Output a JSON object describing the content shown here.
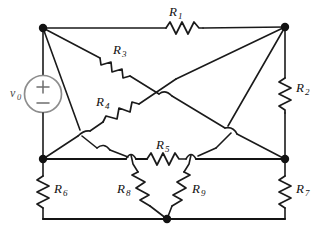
{
  "figure": {
    "kind": "electrical-circuit-schematic",
    "background_color": "#ffffff",
    "wire_color": "#1a1a1a",
    "source_color": "#8d8d8d",
    "width": 323,
    "height": 234
  },
  "source": {
    "name": "voltage-source",
    "label": "v",
    "label_subscript": "0",
    "symbol": "circle",
    "plus_sign": "+",
    "minus_sign": "−",
    "polarity_top": "+",
    "polarity_bottom": "−"
  },
  "resistors": [
    {
      "id": "R1",
      "label": "R",
      "subscript": "1",
      "orientation": "horizontal",
      "label_pos": "above",
      "from_node": "top-left",
      "to_node": "top-right"
    },
    {
      "id": "R2",
      "label": "R",
      "subscript": "2",
      "orientation": "vertical",
      "label_pos": "right",
      "from_node": "top-right",
      "to_node": "right-middle"
    },
    {
      "id": "R3",
      "label": "R",
      "subscript": "3",
      "orientation": "diagonal-down-right",
      "label_pos": "above-right",
      "from_node": "top-left",
      "to_node": "center-upper"
    },
    {
      "id": "R4",
      "label": "R",
      "subscript": "4",
      "orientation": "diagonal-up-right",
      "label_pos": "above-left",
      "from_node": "left-middle",
      "to_node": "center-upper"
    },
    {
      "id": "R5",
      "label": "R",
      "subscript": "5",
      "orientation": "horizontal",
      "label_pos": "above",
      "from_node": "left-middle",
      "to_node": "right-middle"
    },
    {
      "id": "R6",
      "label": "R",
      "subscript": "6",
      "orientation": "vertical",
      "label_pos": "right",
      "from_node": "left-middle",
      "to_node": "bottom-left"
    },
    {
      "id": "R7",
      "label": "R",
      "subscript": "7",
      "orientation": "vertical",
      "label_pos": "right",
      "from_node": "right-middle",
      "to_node": "bottom-right"
    },
    {
      "id": "R8",
      "label": "R",
      "subscript": "8",
      "orientation": "diagonal-down-right",
      "label_pos": "left",
      "from_node": "branch-left",
      "to_node": "bottom-center"
    },
    {
      "id": "R9",
      "label": "R",
      "subscript": "9",
      "orientation": "diagonal-down-left",
      "label_pos": "right",
      "from_node": "branch-right",
      "to_node": "bottom-center"
    }
  ],
  "nodes": [
    {
      "id": "top-left",
      "x": 43,
      "y": 28,
      "dot": true
    },
    {
      "id": "top-right",
      "x": 285,
      "y": 27,
      "dot": true
    },
    {
      "id": "left-middle",
      "x": 43,
      "y": 159,
      "dot": true
    },
    {
      "id": "right-middle",
      "x": 285,
      "y": 159,
      "dot": true
    },
    {
      "id": "bottom-center",
      "x": 167,
      "y": 219,
      "dot": true
    }
  ],
  "crossings": {
    "style": "wire-hop-semicircle",
    "count": 6,
    "meaning": "wires cross without electrical connection"
  }
}
